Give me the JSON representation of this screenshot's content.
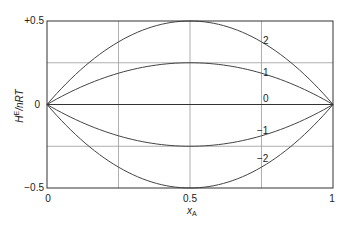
{
  "chart_data": {
    "type": "line",
    "title": "",
    "xlabel": "x_A",
    "ylabel": "H^E/nRT",
    "xlim": [
      0,
      1
    ],
    "ylim": [
      -0.5,
      0.5
    ],
    "grid": true,
    "x_ticks": [
      "0",
      "0.5",
      "1"
    ],
    "y_ticks": [
      "+0.5",
      "0",
      "−0.5"
    ],
    "formula": "H^E/nRT = xi * x_A * (1 - x_A)",
    "x": [
      0,
      0.125,
      0.25,
      0.375,
      0.5,
      0.625,
      0.75,
      0.875,
      1
    ],
    "series": [
      {
        "name": "2",
        "values": [
          0,
          0.219,
          0.375,
          0.469,
          0.5,
          0.469,
          0.375,
          0.219,
          0
        ]
      },
      {
        "name": "1",
        "values": [
          0,
          0.109,
          0.1875,
          0.234,
          0.25,
          0.234,
          0.1875,
          0.109,
          0
        ]
      },
      {
        "name": "0",
        "values": [
          0,
          0,
          0,
          0,
          0,
          0,
          0,
          0,
          0
        ]
      },
      {
        "name": "−1",
        "values": [
          0,
          -0.109,
          -0.1875,
          -0.234,
          -0.25,
          -0.234,
          -0.1875,
          -0.109,
          0
        ]
      },
      {
        "name": "−2",
        "values": [
          0,
          -0.219,
          -0.375,
          -0.469,
          -0.5,
          -0.469,
          -0.375,
          -0.219,
          0
        ]
      }
    ]
  },
  "labels": {
    "y_top": "+0.5",
    "y_mid": "0",
    "y_bottom": "−0.5",
    "x_left": "0",
    "x_mid": "0.5",
    "x_right": "1",
    "ylabel_main": "H",
    "ylabel_sup": "E",
    "ylabel_rest": "/nRT",
    "xlabel_main": "x",
    "xlabel_sub": "A",
    "curve_2": "2",
    "curve_1": "1",
    "curve_0": "0",
    "curve_m1": "−1",
    "curve_m2": "−2"
  },
  "colors": {
    "axis": "#333333",
    "grid": "#888888",
    "curve": "#444444"
  }
}
